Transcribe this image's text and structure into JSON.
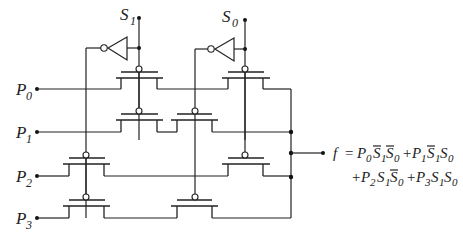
{
  "diagram": {
    "select_inputs": [
      {
        "name": "S",
        "sub": "1"
      },
      {
        "name": "S",
        "sub": "0"
      }
    ],
    "data_inputs": [
      {
        "name": "P",
        "sub": "0"
      },
      {
        "name": "P",
        "sub": "1"
      },
      {
        "name": "P",
        "sub": "2"
      },
      {
        "name": "P",
        "sub": "3"
      }
    ],
    "output": {
      "lhs": "f",
      "eq_sign": "=",
      "line1": [
        {
          "t": "P",
          "s": "0"
        },
        {
          "t": "S",
          "s": "1",
          "bar": true
        },
        {
          "t": "S",
          "s": "0",
          "bar": true
        },
        {
          "op": "+"
        },
        {
          "t": "P",
          "s": "1"
        },
        {
          "t": "S",
          "s": "1",
          "bar": true
        },
        {
          "t": "S",
          "s": "0"
        }
      ],
      "line2": [
        {
          "op": "+"
        },
        {
          "t": "P",
          "s": "2"
        },
        {
          "t": "S",
          "s": "1"
        },
        {
          "t": "S",
          "s": "0",
          "bar": true
        },
        {
          "op": "+"
        },
        {
          "t": "P",
          "s": "3"
        },
        {
          "t": "S",
          "s": "1"
        },
        {
          "t": "S",
          "s": "0"
        }
      ]
    },
    "components": {
      "inverters": 2,
      "transmission_gates": 8
    }
  }
}
